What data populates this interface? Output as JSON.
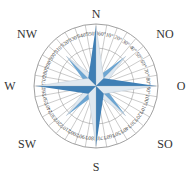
{
  "compass": {
    "center": [
      96,
      86
    ],
    "outer_radius": 62,
    "inner_radius": 38,
    "labels": {
      "n": "N",
      "ne": "NO",
      "e": "O",
      "se": "SO",
      "s": "S",
      "sw": "SW",
      "w": "W",
      "nw": "NW"
    },
    "degree_labels": [
      "360°",
      "10°",
      "20°",
      "30°",
      "40°",
      "50°",
      "60°",
      "70°",
      "80°",
      "90°",
      "100°",
      "110°",
      "120°",
      "130°",
      "140°",
      "150°",
      "160°",
      "170°",
      "180°",
      "190°",
      "200°",
      "210°",
      "220°",
      "230°",
      "240°",
      "250°",
      "260°",
      "270°",
      "280°",
      "290°",
      "300°",
      "310°",
      "320°",
      "330°",
      "340°",
      "350°"
    ],
    "colors": {
      "star_blue": "#3f7fb5",
      "star_light": "#dfe8f0",
      "ring_line": "#888888"
    }
  }
}
